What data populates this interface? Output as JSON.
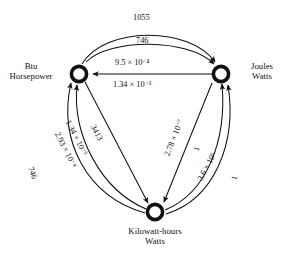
{
  "diagram": {
    "type": "energy-unit-conversion-graph",
    "nodes": [
      {
        "id": "btu",
        "line1": "Btu",
        "line2": "Horsepower"
      },
      {
        "id": "joules",
        "line1": "Joules",
        "line2": "Watts"
      },
      {
        "id": "kwh",
        "line1": "Kilowatt-hours",
        "line2": "Watts"
      }
    ],
    "edge_labels": {
      "btu_to_joules_outer": "1055",
      "hp_to_watts_inner": "746",
      "joules_to_btu_upper": "9.5 × 10⁻⁴",
      "watts_to_hp_lower": "1.34 × 10⁻³",
      "btu_to_kwh_straight": "3413",
      "kwh_to_btu_inner": "1.34 × 10⁻³",
      "kwh_to_hp_mid": "2.93 × 10⁻⁴",
      "kwh_to_hp_outer": "746",
      "joules_to_kwh_straight": "2.78 × 10⁻⁷",
      "watts_to_watts_inner": "1",
      "kwh_to_joules_arc": "3.6 × 10⁶",
      "watts_to_watts_outer": "1"
    },
    "colors": {
      "ink": "#111111",
      "background": "#ffffff"
    }
  }
}
